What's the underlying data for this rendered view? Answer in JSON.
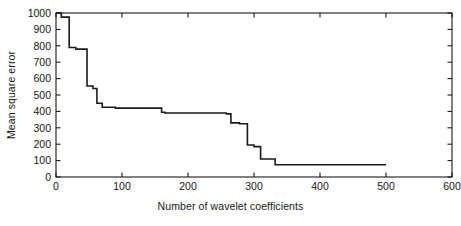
{
  "chart_data": {
    "type": "line",
    "title": "",
    "xlabel": "Number of wavelet coefficients",
    "ylabel": "Mean square error",
    "xlim": [
      0,
      600
    ],
    "ylim": [
      0,
      1000
    ],
    "xticks": [
      0,
      100,
      200,
      300,
      400,
      500,
      600
    ],
    "xticklabels": [
      "0",
      "100",
      "200",
      "300",
      "400",
      "500",
      "600"
    ],
    "yticks": [
      0,
      100,
      200,
      300,
      400,
      500,
      600,
      700,
      800,
      900,
      1000
    ],
    "yticklabels": [
      "0",
      "100",
      "200",
      "300",
      "400",
      "500",
      "600",
      "700",
      "800",
      "900",
      "1000"
    ],
    "grid": false,
    "legend": null,
    "line_color": "#1a1a1a",
    "line_width": 1.6,
    "step_style": "post",
    "series": [
      {
        "name": "Mean square error",
        "x": [
          0,
          8,
          8,
          20,
          20,
          30,
          30,
          47,
          47,
          56,
          56,
          62,
          62,
          70,
          70,
          90,
          90,
          160,
          160,
          165,
          165,
          258,
          258,
          265,
          265,
          278,
          278,
          290,
          290,
          300,
          300,
          310,
          310,
          332,
          332,
          500
        ],
        "y": [
          1000,
          1000,
          975,
          975,
          790,
          790,
          780,
          780,
          555,
          555,
          540,
          540,
          450,
          450,
          425,
          425,
          420,
          420,
          395,
          395,
          390,
          390,
          385,
          385,
          330,
          330,
          325,
          325,
          195,
          195,
          185,
          185,
          110,
          110,
          75,
          75
        ]
      }
    ],
    "annotations": []
  },
  "geometry": {
    "plot_left": 56,
    "plot_right": 452,
    "plot_top": 13,
    "plot_bottom": 177
  }
}
